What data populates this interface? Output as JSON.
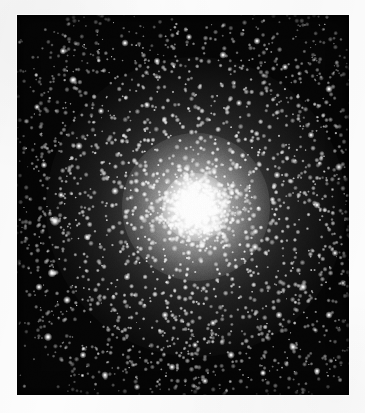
{
  "page": {
    "background_color": "#fdfdfd",
    "width": 365,
    "height": 413,
    "caption": "",
    "title": ""
  },
  "image_frame": {
    "name": "globular-cluster-photograph",
    "left": 17,
    "top": 15,
    "width": 332,
    "height": 380,
    "sky_background_color": "#050505",
    "border_color": "#ffffff",
    "medium": "black-and-white halftone photographic reproduction"
  },
  "chart_data": {
    "type": "scatter",
    "title": "",
    "subtitle": "",
    "xlabel": "",
    "ylabel": "",
    "grid": false,
    "legend_position": "none",
    "xlim": [
      0,
      332
    ],
    "ylim": [
      0,
      380
    ],
    "core": {
      "center_x": 179,
      "center_y": 192,
      "saturated_radius": 34,
      "bright_halo_radius": 74,
      "outer_halo_radius": 150,
      "peak_brightness": 255,
      "background_brightness": 5
    },
    "star_counts": {
      "core_unresolved": 900,
      "inner_halo_resolved": 1500,
      "outer_halo_resolved": 1100,
      "sparse_field": 260,
      "bright_field_stars": 46
    },
    "radial_profile": {
      "radius_px": [
        0,
        10,
        20,
        30,
        40,
        55,
        70,
        90,
        110,
        130,
        150,
        175,
        200
      ],
      "brightness": [
        255,
        252,
        244,
        228,
        200,
        156,
        118,
        78,
        50,
        30,
        18,
        10,
        6
      ]
    },
    "bright_field_stars": [
      {
        "x": 38,
        "y": 206,
        "mag": 1.0
      },
      {
        "x": 46,
        "y": 36,
        "mag": 0.55
      },
      {
        "x": 56,
        "y": 65,
        "mag": 0.7
      },
      {
        "x": 62,
        "y": 131,
        "mag": 0.62
      },
      {
        "x": 27,
        "y": 150,
        "mag": 0.48
      },
      {
        "x": 35,
        "y": 258,
        "mag": 0.82
      },
      {
        "x": 22,
        "y": 272,
        "mag": 0.58
      },
      {
        "x": 50,
        "y": 285,
        "mag": 0.66
      },
      {
        "x": 31,
        "y": 322,
        "mag": 0.74
      },
      {
        "x": 66,
        "y": 340,
        "mag": 0.52
      },
      {
        "x": 88,
        "y": 360,
        "mag": 0.6
      },
      {
        "x": 120,
        "y": 372,
        "mag": 0.44
      },
      {
        "x": 155,
        "y": 352,
        "mag": 0.56
      },
      {
        "x": 188,
        "y": 366,
        "mag": 0.5
      },
      {
        "x": 214,
        "y": 340,
        "mag": 0.64
      },
      {
        "x": 246,
        "y": 358,
        "mag": 0.46
      },
      {
        "x": 276,
        "y": 332,
        "mag": 0.68
      },
      {
        "x": 300,
        "y": 356,
        "mag": 0.54
      },
      {
        "x": 312,
        "y": 300,
        "mag": 0.6
      },
      {
        "x": 286,
        "y": 272,
        "mag": 0.72
      },
      {
        "x": 318,
        "y": 238,
        "mag": 0.5
      },
      {
        "x": 300,
        "y": 190,
        "mag": 0.58
      },
      {
        "x": 322,
        "y": 152,
        "mag": 0.66
      },
      {
        "x": 294,
        "y": 120,
        "mag": 0.52
      },
      {
        "x": 312,
        "y": 74,
        "mag": 0.62
      },
      {
        "x": 268,
        "y": 52,
        "mag": 0.48
      },
      {
        "x": 240,
        "y": 26,
        "mag": 0.56
      },
      {
        "x": 206,
        "y": 40,
        "mag": 0.6
      },
      {
        "x": 172,
        "y": 22,
        "mag": 0.44
      },
      {
        "x": 140,
        "y": 46,
        "mag": 0.52
      },
      {
        "x": 108,
        "y": 28,
        "mag": 0.58
      },
      {
        "x": 84,
        "y": 96,
        "mag": 0.46
      },
      {
        "x": 98,
        "y": 176,
        "mag": 0.64
      },
      {
        "x": 70,
        "y": 222,
        "mag": 0.5
      },
      {
        "x": 260,
        "y": 160,
        "mag": 0.54
      },
      {
        "x": 238,
        "y": 232,
        "mag": 0.62
      },
      {
        "x": 148,
        "y": 300,
        "mag": 0.58
      },
      {
        "x": 110,
        "y": 262,
        "mag": 0.52
      },
      {
        "x": 326,
        "y": 268,
        "mag": 0.44
      },
      {
        "x": 20,
        "y": 92,
        "mag": 0.42
      },
      {
        "x": 196,
        "y": 308,
        "mag": 0.48
      },
      {
        "x": 262,
        "y": 300,
        "mag": 0.56
      },
      {
        "x": 130,
        "y": 90,
        "mag": 0.5
      },
      {
        "x": 222,
        "y": 88,
        "mag": 0.46
      },
      {
        "x": 178,
        "y": 330,
        "mag": 0.42
      },
      {
        "x": 44,
        "y": 180,
        "mag": 0.46
      }
    ]
  }
}
